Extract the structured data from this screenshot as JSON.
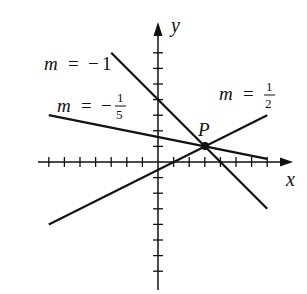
{
  "diagram": {
    "title": "",
    "origin_px": [
      158,
      162
    ],
    "unit_px": 15.6,
    "axes": {
      "x": {
        "label": "x",
        "min": -7,
        "max": 7,
        "ticks": [
          -7,
          -6,
          -5,
          -4,
          -3,
          -2,
          -1,
          1,
          2,
          3,
          4,
          5,
          6,
          7
        ]
      },
      "y": {
        "label": "y",
        "min": -7,
        "max": 7,
        "ticks": [
          -7,
          -6,
          -5,
          -4,
          -3,
          -2,
          -1,
          1,
          2,
          3,
          4,
          5,
          6,
          7
        ]
      }
    },
    "point": {
      "label": "P",
      "x": 3,
      "y": 1
    },
    "lines": [
      {
        "name": "m-neg-1",
        "label_var": "m",
        "label_eq": "=",
        "label_sign": "−",
        "label_value": "1",
        "slope": -1,
        "from": [
          -3,
          7
        ],
        "to": [
          7,
          -3
        ]
      },
      {
        "name": "m-neg-1-5",
        "label_var": "m",
        "label_eq": "=",
        "label_sign": "−",
        "label_num": "1",
        "label_den": "5",
        "slope": -0.2,
        "from": [
          -7,
          3
        ],
        "to": [
          7,
          0.2
        ]
      },
      {
        "name": "m-1-2",
        "label_var": "m",
        "label_eq": "=",
        "label_num": "1",
        "label_den": "2",
        "slope": 0.5,
        "from": [
          -7,
          -4
        ],
        "to": [
          7,
          3
        ]
      }
    ],
    "colors": {
      "stroke": "#111111",
      "background": "#ffffff"
    }
  }
}
